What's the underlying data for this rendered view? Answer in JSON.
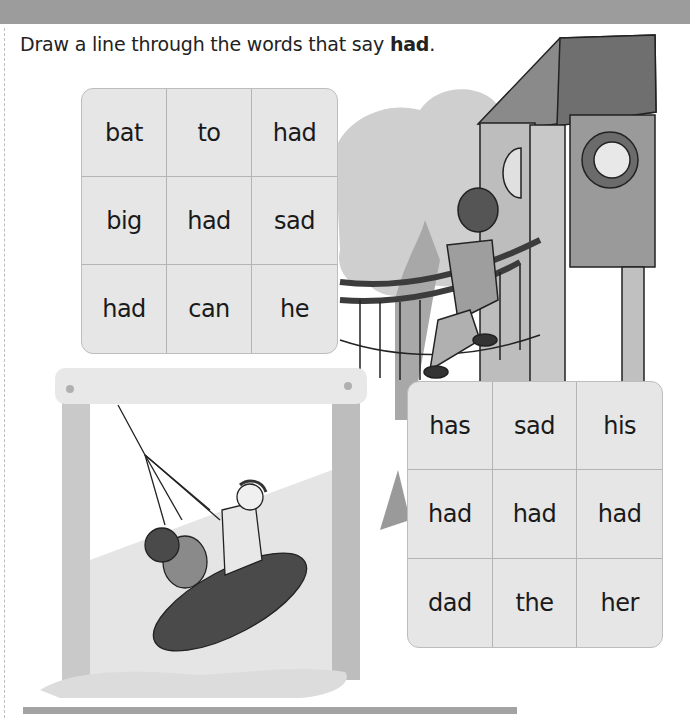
{
  "worksheet": {
    "instruction": {
      "prefix": "Draw a line through the words that say ",
      "target_word": "had",
      "suffix": "."
    },
    "grids": [
      {
        "id": "grid-1",
        "cells": [
          "bat",
          "to",
          "had",
          "big",
          "had",
          "sad",
          "had",
          "can",
          "he"
        ]
      },
      {
        "id": "grid-2",
        "cells": [
          "has",
          "sad",
          "his",
          "had",
          "had",
          "had",
          "dad",
          "the",
          "her"
        ]
      }
    ],
    "illustrations": {
      "tower": "playground-tower-with-boy-in-window",
      "climber": "girl-climbing-rope-bridge",
      "swing": "children-on-tire-swing",
      "tree": "tree-background"
    }
  },
  "colors": {
    "banner": "#9c9c9c",
    "grid_fill": "#e6e6e6",
    "grid_line": "#b4b4b4",
    "text": "#1a1a1a"
  }
}
